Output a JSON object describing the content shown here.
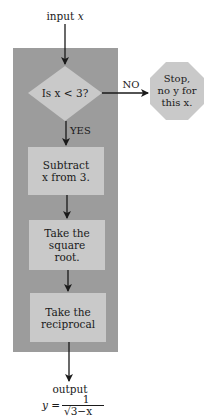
{
  "input": {
    "label": "input",
    "var": "x"
  },
  "decision": {
    "text": "Is x < 3?"
  },
  "branches": {
    "no": "NO",
    "yes": "YES"
  },
  "stop": {
    "text": "Stop,\nno y for\nthis x."
  },
  "steps": [
    {
      "text": "Subtract\nx from 3."
    },
    {
      "text": "Take the\nsquare\nroot."
    },
    {
      "text": "Take the\nreciprocal"
    }
  ],
  "output": {
    "label": "output",
    "formula_lhs": "y =",
    "numerator": "1",
    "denominator": "√3−x"
  },
  "colors": {
    "panel": "#9c9c9c",
    "box": "#c9c9c9",
    "stop": "#c9c9c9",
    "line": "#1a1a1a"
  }
}
